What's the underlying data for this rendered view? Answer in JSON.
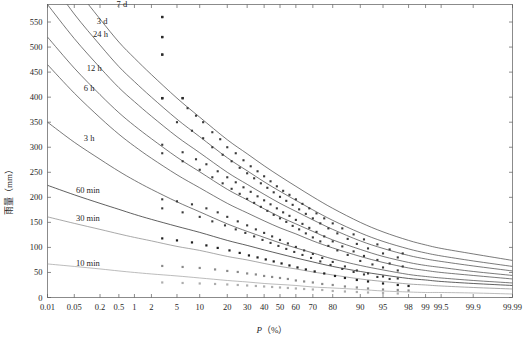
{
  "chart_data": {
    "type": "line",
    "title": "",
    "xlabel": "P（%）",
    "ylabel": "雨量（mm）",
    "grid": false,
    "legend_position": "inline-curve-labels",
    "xscale": "probability",
    "x_ticks": [
      "0.01",
      "0.05",
      "0.2",
      "0.5",
      "1",
      "2",
      "5",
      "10",
      "20",
      "30",
      "40",
      "50",
      "60",
      "70",
      "80",
      "90",
      "95",
      "98",
      "99",
      "99.5",
      "99.9",
      "99.99"
    ],
    "x_tick_values": [
      0.01,
      0.05,
      0.2,
      0.5,
      1,
      2,
      5,
      10,
      20,
      30,
      40,
      50,
      60,
      70,
      80,
      90,
      95,
      98,
      99,
      99.5,
      99.9,
      99.99
    ],
    "y_ticks": [
      "0",
      "50",
      "100",
      "150",
      "200",
      "250",
      "300",
      "350",
      "400",
      "450",
      "500",
      "550"
    ],
    "y_tick_values": [
      0,
      50,
      100,
      150,
      200,
      250,
      300,
      350,
      400,
      450,
      500,
      550
    ],
    "ylim": [
      0,
      585
    ],
    "xlim": [
      0.01,
      99.99
    ],
    "series": [
      {
        "name": "7 d",
        "label": "7 d",
        "color": "#4d4d4d",
        "label_x": 0.45,
        "label_y": 580,
        "x": [
          0.01,
          0.05,
          0.2,
          0.5,
          1,
          2,
          5,
          10,
          20,
          30,
          40,
          50,
          60,
          70,
          80,
          90,
          95,
          98,
          99,
          99.5,
          99.9,
          99.99
        ],
        "y": [
          700,
          622,
          556,
          510,
          478,
          445,
          398,
          360,
          315,
          287,
          263,
          242,
          222,
          201,
          178,
          150,
          131,
          114,
          105,
          98,
          87,
          74
        ]
      },
      {
        "name": "3 d",
        "label": "3 d",
        "color": "#4d4d4d",
        "label_x": 0.17,
        "label_y": 546,
        "x": [
          0.01,
          0.05,
          0.2,
          0.5,
          1,
          2,
          5,
          10,
          20,
          30,
          40,
          50,
          60,
          70,
          80,
          90,
          95,
          98,
          99,
          99.5,
          99.9,
          99.99
        ],
        "y": [
          640,
          566,
          504,
          461,
          431,
          400,
          356,
          321,
          279,
          253,
          231,
          212,
          194,
          175,
          154,
          129,
          112,
          97,
          89,
          83,
          73,
          62
        ]
      },
      {
        "name": "24 h",
        "label": "24 h",
        "color": "#4d4d4d",
        "label_x": 0.14,
        "label_y": 520,
        "x": [
          0.01,
          0.05,
          0.2,
          0.5,
          1,
          2,
          5,
          10,
          20,
          30,
          40,
          50,
          60,
          70,
          80,
          90,
          95,
          98,
          99,
          99.5,
          99.9,
          99.99
        ],
        "y": [
          585,
          517,
          459,
          419,
          391,
          362,
          321,
          289,
          250,
          226,
          206,
          188,
          172,
          155,
          136,
          113,
          98,
          84,
          77,
          72,
          63,
          53
        ]
      },
      {
        "name": "12 h",
        "label": "12 h",
        "color": "#4d4d4d",
        "label_x": 0.1,
        "label_y": 452,
        "x": [
          0.01,
          0.05,
          0.2,
          0.5,
          1,
          2,
          5,
          10,
          20,
          30,
          40,
          50,
          60,
          70,
          80,
          90,
          95,
          98,
          99,
          99.5,
          99.9,
          99.99
        ],
        "y": [
          520,
          458,
          405,
          369,
          343,
          317,
          280,
          251,
          216,
          195,
          177,
          161,
          147,
          132,
          115,
          96,
          82,
          70,
          64,
          60,
          52,
          44
        ]
      },
      {
        "name": "6 h",
        "label": "6 h",
        "color": "#4d4d4d",
        "label_x": 0.085,
        "label_y": 412,
        "x": [
          0.01,
          0.05,
          0.2,
          0.5,
          1,
          2,
          5,
          10,
          20,
          30,
          40,
          50,
          60,
          70,
          80,
          90,
          95,
          98,
          99,
          99.5,
          99.9,
          99.99
        ],
        "y": [
          465,
          408,
          359,
          326,
          302,
          278,
          245,
          219,
          188,
          169,
          153,
          139,
          127,
          113,
          99,
          82,
          70,
          59,
          54,
          50,
          44,
          37
        ]
      },
      {
        "name": "3 h",
        "label": "3 h",
        "color": "#4d4d4d",
        "label_x": 0.085,
        "label_y": 312,
        "x": [
          0.01,
          0.05,
          0.2,
          0.5,
          1,
          2,
          5,
          10,
          20,
          30,
          40,
          50,
          60,
          70,
          80,
          90,
          95,
          98,
          99,
          99.5,
          99.9,
          99.99
        ],
        "y": [
          350,
          310,
          276,
          252,
          234,
          216,
          191,
          171,
          147,
          132,
          120,
          109,
          99,
          89,
          77,
          64,
          55,
          46,
          42,
          39,
          34,
          29
        ]
      },
      {
        "name": "60 min",
        "label": "60 min",
        "color": "#2b2b2b",
        "label_x": 0.055,
        "label_y": 208,
        "x": [
          0.01,
          0.05,
          0.2,
          0.5,
          1,
          2,
          5,
          10,
          20,
          30,
          40,
          50,
          60,
          70,
          80,
          90,
          95,
          98,
          99,
          99.5,
          99.9,
          99.99
        ],
        "y": [
          224,
          205,
          188,
          176,
          166,
          156,
          142,
          130,
          114,
          104,
          95,
          87,
          79,
          71,
          62,
          52,
          45,
          38,
          35,
          32,
          28,
          24
        ]
      },
      {
        "name": "30 min",
        "label": "30 min",
        "color": "#8c8c8c",
        "label_x": 0.055,
        "label_y": 152,
        "x": [
          0.01,
          0.05,
          0.2,
          0.5,
          1,
          2,
          5,
          10,
          20,
          30,
          40,
          50,
          60,
          70,
          80,
          90,
          95,
          98,
          99,
          99.5,
          99.9,
          99.99
        ],
        "y": [
          161,
          148,
          136,
          127,
          120,
          113,
          102,
          94,
          82,
          75,
          68,
          62,
          57,
          51,
          45,
          37,
          32,
          27,
          25,
          23,
          20,
          17
        ]
      },
      {
        "name": "10 min",
        "label": "10 min",
        "color": "#a6a6a6",
        "label_x": 0.055,
        "label_y": 62,
        "x": [
          0.01,
          0.05,
          0.2,
          0.5,
          1,
          2,
          5,
          10,
          20,
          30,
          40,
          50,
          60,
          70,
          80,
          90,
          95,
          98,
          99,
          99.5,
          99.9,
          99.99
        ],
        "y": [
          67,
          62,
          57,
          53,
          50,
          47,
          43,
          39,
          34,
          31,
          28,
          26,
          24,
          21,
          19,
          16,
          13,
          11,
          10,
          10,
          9,
          7
        ]
      }
    ],
    "scatter_series": [
      {
        "name": "7 d points",
        "color": "#3a3a3a",
        "marker": "square",
        "size": 2.1,
        "x": [
          3,
          3,
          3,
          3,
          6,
          7,
          9,
          11,
          14,
          17,
          20,
          24,
          28,
          32,
          36,
          40,
          44,
          48,
          52,
          56,
          60,
          64,
          68,
          72,
          76,
          80,
          84,
          88,
          91,
          94,
          96,
          97.5
        ],
        "y": [
          560,
          520,
          485,
          398,
          398,
          378,
          363,
          350,
          330,
          316,
          300,
          288,
          274,
          262,
          252,
          242,
          232,
          222,
          213,
          205,
          196,
          187,
          178,
          168,
          158,
          148,
          138,
          126,
          116,
          106,
          96,
          88
        ]
      },
      {
        "name": "3 d points",
        "color": "#3a3a3a",
        "marker": "square",
        "size": 2.1,
        "x": [
          3,
          5,
          8,
          11,
          14,
          18,
          22,
          26,
          30,
          34,
          38,
          42,
          46,
          50,
          54,
          58,
          62,
          66,
          70,
          74,
          78,
          82,
          86,
          89,
          92,
          95,
          97
        ],
        "y": [
          398,
          350,
          333,
          318,
          300,
          285,
          272,
          259,
          248,
          238,
          228,
          219,
          210,
          201,
          193,
          185,
          176,
          167,
          158,
          148,
          138,
          128,
          117,
          107,
          98,
          88,
          80
        ]
      },
      {
        "name": "24 h points",
        "color": "#3a3a3a",
        "marker": "square",
        "size": 2.1,
        "x": [
          3,
          6,
          9,
          12,
          16,
          20,
          24,
          28,
          32,
          36,
          40,
          44,
          48,
          52,
          56,
          60,
          64,
          68,
          72,
          76,
          80,
          84,
          88,
          91,
          94,
          96,
          97.5
        ],
        "y": [
          305,
          290,
          276,
          266,
          252,
          240,
          230,
          220,
          211,
          202,
          194,
          186,
          178,
          170,
          163,
          155,
          147,
          139,
          131,
          122,
          112,
          102,
          92,
          83,
          75,
          68,
          62
        ]
      },
      {
        "name": "12 h points",
        "color": "#3a3a3a",
        "marker": "square",
        "size": 2.1,
        "x": [
          3,
          6,
          10,
          14,
          18,
          22,
          26,
          30,
          34,
          38,
          42,
          46,
          50,
          54,
          58,
          62,
          66,
          70,
          74,
          78,
          82,
          86,
          90,
          93,
          95,
          97
        ],
        "y": [
          288,
          272,
          255,
          240,
          228,
          217,
          207,
          197,
          189,
          181,
          173,
          165,
          158,
          151,
          143,
          136,
          128,
          120,
          112,
          103,
          94,
          85,
          73,
          66,
          60,
          54
        ]
      },
      {
        "name": "6 h points",
        "color": "#3a3a3a",
        "marker": "square",
        "size": 2.1,
        "x": [
          3,
          5,
          8,
          12,
          16,
          20,
          25,
          30,
          35,
          40,
          45,
          50,
          55,
          60,
          65,
          70,
          75,
          80,
          85,
          89,
          92,
          95,
          97
        ],
        "y": [
          196,
          192,
          186,
          178,
          170,
          161,
          152,
          144,
          136,
          129,
          122,
          115,
          108,
          101,
          94,
          87,
          79,
          71,
          62,
          54,
          48,
          42,
          38
        ]
      },
      {
        "name": "3 h points",
        "color": "#3a3a3a",
        "marker": "square",
        "size": 2.1,
        "x": [
          3,
          6,
          10,
          14,
          19,
          24,
          29,
          34,
          39,
          44,
          49,
          54,
          59,
          64,
          69,
          74,
          79,
          84,
          88,
          91,
          94,
          96
        ],
        "y": [
          178,
          170,
          161,
          152,
          144,
          136,
          129,
          122,
          115,
          109,
          103,
          97,
          91,
          85,
          79,
          72,
          65,
          57,
          51,
          46,
          41,
          37
        ]
      },
      {
        "name": "60 min points",
        "color": "#1f1f1f",
        "marker": "square",
        "size": 2.2,
        "x": [
          3,
          5,
          8,
          12,
          16,
          21,
          26,
          31,
          36,
          41,
          46,
          51,
          56,
          61,
          66,
          71,
          76,
          81,
          85,
          89,
          92,
          95,
          97,
          98
        ],
        "y": [
          118,
          114,
          110,
          104,
          99,
          94,
          89,
          84,
          80,
          76,
          72,
          68,
          64,
          60,
          56,
          52,
          48,
          43,
          39,
          35,
          32,
          28,
          25,
          23
        ]
      },
      {
        "name": "30 min points",
        "color": "#8a8a8a",
        "marker": "square",
        "size": 2.2,
        "x": [
          3,
          6,
          10,
          15,
          20,
          25,
          30,
          35,
          40,
          45,
          50,
          55,
          60,
          65,
          70,
          75,
          80,
          85,
          89,
          92,
          95,
          97,
          98
        ],
        "y": [
          63,
          61,
          59,
          56,
          53,
          51,
          48,
          46,
          43,
          41,
          39,
          37,
          34,
          32,
          30,
          27,
          25,
          22,
          20,
          18,
          16,
          15,
          14
        ]
      },
      {
        "name": "10 min points",
        "color": "#adadad",
        "marker": "square",
        "size": 2.2,
        "x": [
          3,
          6,
          10,
          15,
          20,
          25,
          30,
          35,
          40,
          45,
          50,
          55,
          60,
          65,
          70,
          75,
          80,
          85,
          89,
          92,
          95,
          97
        ],
        "y": [
          30,
          29,
          28,
          27,
          26,
          25,
          24,
          23,
          22,
          21,
          20,
          19,
          18,
          17,
          16,
          15,
          13,
          12,
          11,
          10,
          9,
          8
        ]
      }
    ],
    "outliers": {
      "name": "high outliers",
      "color": "#2b2b2b",
      "x": [
        3,
        3,
        3,
        3,
        6
      ],
      "y": [
        560,
        520,
        485,
        398,
        398
      ]
    }
  },
  "axes": {
    "y_axis_label": "雨量（mm）",
    "x_axis_label_italic": "P",
    "x_axis_label_rest": "（%）"
  }
}
